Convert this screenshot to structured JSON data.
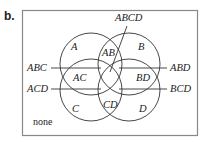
{
  "panel_label": "b.",
  "diagram": {
    "type": "four-set Venn diagram",
    "sets": [
      {
        "name": "A",
        "cx": 91,
        "cy": 64,
        "r": 31
      },
      {
        "name": "B",
        "cx": 129,
        "cy": 64,
        "r": 31
      },
      {
        "name": "C",
        "cx": 91,
        "cy": 90,
        "r": 31
      },
      {
        "name": "D",
        "cx": 129,
        "cy": 90,
        "r": 31
      }
    ],
    "region_labels": {
      "A": "A",
      "B": "B",
      "C": "C",
      "D": "D",
      "AB": "AB",
      "AC": "AC",
      "BD": "BD",
      "CD": "CD",
      "none": "none"
    },
    "callouts": {
      "ABCD": "ABCD",
      "ABC": "ABC",
      "ACD": "ACD",
      "ABD": "ABD",
      "BCD": "BCD"
    },
    "colors": {
      "stroke": "#333333",
      "frame": "#888888",
      "text": "#222222"
    }
  }
}
